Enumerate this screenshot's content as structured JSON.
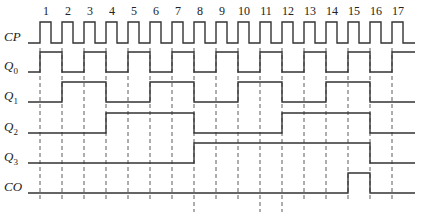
{
  "diagram": {
    "type": "timing",
    "signals": [
      {
        "name": "CP",
        "sub": "",
        "y_high": 22,
        "y_low": 43
      },
      {
        "name": "Q",
        "sub": "0",
        "y_high": 52,
        "y_low": 72
      },
      {
        "name": "Q",
        "sub": "1",
        "y_high": 82,
        "y_low": 102
      },
      {
        "name": "Q",
        "sub": "2",
        "y_high": 113,
        "y_low": 133
      },
      {
        "name": "Q",
        "sub": "3",
        "y_high": 143,
        "y_low": 163
      },
      {
        "name": "CO",
        "sub": "",
        "y_high": 173,
        "y_low": 193
      }
    ],
    "clock_numbers": [
      "1",
      "2",
      "3",
      "4",
      "5",
      "6",
      "7",
      "8",
      "9",
      "10",
      "11",
      "12",
      "13",
      "14",
      "15",
      "16",
      "17"
    ],
    "edges_x": [
      40,
      62,
      84,
      106,
      128,
      150,
      172,
      194,
      216,
      238,
      260,
      282,
      304,
      326,
      348,
      370,
      392
    ],
    "states": {
      "Q0": [
        1,
        0,
        1,
        0,
        1,
        0,
        1,
        0,
        1,
        0,
        1,
        0,
        1,
        0,
        1,
        0,
        1
      ],
      "Q1": [
        0,
        1,
        1,
        0,
        0,
        1,
        1,
        0,
        0,
        1,
        1,
        0,
        0,
        1,
        1,
        0,
        0
      ],
      "Q2": [
        0,
        0,
        0,
        1,
        1,
        1,
        1,
        0,
        0,
        0,
        0,
        1,
        1,
        1,
        1,
        0,
        0
      ],
      "Q3": [
        0,
        0,
        0,
        0,
        0,
        0,
        0,
        1,
        1,
        1,
        1,
        1,
        1,
        1,
        1,
        0,
        0
      ],
      "CO": [
        0,
        0,
        0,
        0,
        0,
        0,
        0,
        0,
        0,
        0,
        0,
        0,
        0,
        0,
        1,
        0,
        0
      ]
    }
  }
}
